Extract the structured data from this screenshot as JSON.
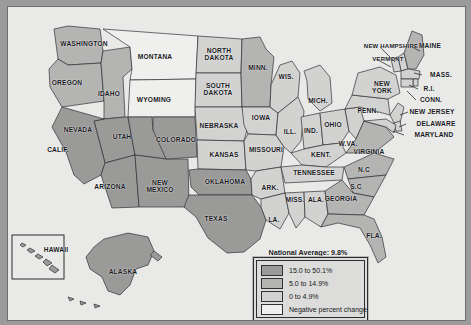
{
  "map": {
    "title_note": "National Average: 9.8%",
    "colors": {
      "dark": "#9a9a98",
      "medium": "#b4b4b2",
      "light": "#d2d2d0",
      "white": "#efefed",
      "water": "#e9e9e7",
      "outline": "#2f3134",
      "background": "#9b9b9b"
    },
    "legend": {
      "items": [
        {
          "label": "15.0 to 50.1%",
          "swatch": "dark"
        },
        {
          "label": "5.0 to 14.9%",
          "swatch": "medium"
        },
        {
          "label": "0 to 4.9%",
          "swatch": "light"
        },
        {
          "label": "Negative percent change",
          "swatch": "white"
        }
      ]
    },
    "states": [
      {
        "name": "WASHINGTON",
        "x": 76,
        "y": 37,
        "size": 6.6,
        "shade": "medium"
      },
      {
        "name": "OREGON",
        "x": 59,
        "y": 76,
        "size": 6.6,
        "shade": "medium"
      },
      {
        "name": "IDAHO",
        "x": 101,
        "y": 87,
        "size": 6.6,
        "shade": "medium"
      },
      {
        "name": "MONTANA",
        "x": 147,
        "y": 50,
        "size": 6.6,
        "shade": "white"
      },
      {
        "name": "WYOMING",
        "x": 146,
        "y": 93,
        "size": 6.6,
        "shade": "white"
      },
      {
        "name": "NEVADA",
        "x": 70,
        "y": 123,
        "size": 6.6,
        "shade": "dark"
      },
      {
        "name": "UTAH",
        "x": 114,
        "y": 130,
        "size": 6.6,
        "shade": "dark"
      },
      {
        "name": "CALIF.",
        "x": 50,
        "y": 143,
        "size": 6.6,
        "shade": "dark"
      },
      {
        "name": "ARIZONA",
        "x": 102,
        "y": 180,
        "size": 6.6,
        "shade": "dark"
      },
      {
        "name": "NEW\nMEXICO",
        "x": 152,
        "y": 180,
        "size": 6.6,
        "shade": "dark"
      },
      {
        "name": "COLORADO",
        "x": 168,
        "y": 133,
        "size": 6.6,
        "shade": "dark"
      },
      {
        "name": "NORTH\nDAKOTA",
        "x": 211,
        "y": 48,
        "size": 6.6,
        "shade": "light"
      },
      {
        "name": "SOUTH\nDAKOTA",
        "x": 210,
        "y": 83,
        "size": 6.6,
        "shade": "light"
      },
      {
        "name": "NEBRASKA",
        "x": 211,
        "y": 119,
        "size": 6.6,
        "shade": "light"
      },
      {
        "name": "KANSAS",
        "x": 216,
        "y": 148,
        "size": 6.6,
        "shade": "light"
      },
      {
        "name": "OKLAHOMA",
        "x": 217,
        "y": 175,
        "size": 6.6,
        "shade": "dark"
      },
      {
        "name": "TEXAS",
        "x": 208,
        "y": 212,
        "size": 6.6,
        "shade": "dark"
      },
      {
        "name": "MINN.",
        "x": 250,
        "y": 61,
        "size": 6.6,
        "shade": "medium"
      },
      {
        "name": "IOWA",
        "x": 253,
        "y": 111,
        "size": 6.6,
        "shade": "light"
      },
      {
        "name": "MISSOURI",
        "x": 258,
        "y": 143,
        "size": 6.6,
        "shade": "light"
      },
      {
        "name": "ARK.",
        "x": 262,
        "y": 181,
        "size": 6.6,
        "shade": "light"
      },
      {
        "name": "LA.",
        "x": 266,
        "y": 213,
        "size": 6.6,
        "shade": "light"
      },
      {
        "name": "MISS.",
        "x": 287,
        "y": 193,
        "size": 6.6,
        "shade": "light"
      },
      {
        "name": "ALA.",
        "x": 308,
        "y": 193,
        "size": 6.6,
        "shade": "light"
      },
      {
        "name": "WIS.",
        "x": 278,
        "y": 70,
        "size": 6.6,
        "shade": "light"
      },
      {
        "name": "ILL.",
        "x": 282,
        "y": 125,
        "size": 6.6,
        "shade": "light"
      },
      {
        "name": "IND.",
        "x": 303,
        "y": 124,
        "size": 6.6,
        "shade": "light"
      },
      {
        "name": "MICH.",
        "x": 310,
        "y": 94,
        "size": 6.6,
        "shade": "light"
      },
      {
        "name": "OHIO",
        "x": 325,
        "y": 118,
        "size": 6.6,
        "shade": "light"
      },
      {
        "name": "KENT.",
        "x": 313,
        "y": 148,
        "size": 6.6,
        "shade": "light"
      },
      {
        "name": "TENNESSEE",
        "x": 306,
        "y": 166,
        "size": 6.6,
        "shade": "light"
      },
      {
        "name": "W.VA.",
        "x": 340,
        "y": 137,
        "size": 6.6,
        "shade": "light"
      },
      {
        "name": "VIRGINIA",
        "x": 361,
        "y": 145,
        "size": 6.6,
        "shade": "medium"
      },
      {
        "name": "N.C",
        "x": 356,
        "y": 163,
        "size": 6.6,
        "shade": "medium"
      },
      {
        "name": "S.C",
        "x": 348,
        "y": 180,
        "size": 6.6,
        "shade": "medium"
      },
      {
        "name": "GEORGIA",
        "x": 333,
        "y": 192,
        "size": 6.6,
        "shade": "medium"
      },
      {
        "name": "FLA.",
        "x": 366,
        "y": 229,
        "size": 6.6,
        "shade": "medium"
      },
      {
        "name": "PENN.",
        "x": 360,
        "y": 104,
        "size": 6.6,
        "shade": "light"
      },
      {
        "name": "NEW\nYORK",
        "x": 374,
        "y": 81,
        "size": 6.6,
        "shade": "light"
      },
      {
        "name": "NEW HAMPSHIRE",
        "x": 383,
        "y": 39,
        "size": 6.0,
        "shade": "light"
      },
      {
        "name": "VERMONT",
        "x": 380,
        "y": 52,
        "size": 6.0,
        "shade": "light"
      },
      {
        "name": "MAINE",
        "x": 422,
        "y": 39,
        "size": 6.6,
        "shade": "medium"
      },
      {
        "name": "MASS.",
        "x": 433,
        "y": 68,
        "size": 6.6,
        "shade": "light"
      },
      {
        "name": "R.I.",
        "x": 421,
        "y": 82,
        "size": 6.6,
        "shade": "light"
      },
      {
        "name": "CONN.",
        "x": 423,
        "y": 93,
        "size": 6.6,
        "shade": "light"
      },
      {
        "name": "NEW JERSEY",
        "x": 424,
        "y": 105,
        "size": 6.6,
        "shade": "light"
      },
      {
        "name": "DELAWARE",
        "x": 428,
        "y": 117,
        "size": 6.6,
        "shade": "light"
      },
      {
        "name": "MARYLAND",
        "x": 426,
        "y": 128,
        "size": 6.6,
        "shade": "light"
      },
      {
        "name": "HAWAII",
        "x": 48,
        "y": 243,
        "size": 6.6,
        "shade": "dark"
      },
      {
        "name": "ALASKA",
        "x": 115,
        "y": 265,
        "size": 6.6,
        "shade": "dark"
      }
    ]
  }
}
